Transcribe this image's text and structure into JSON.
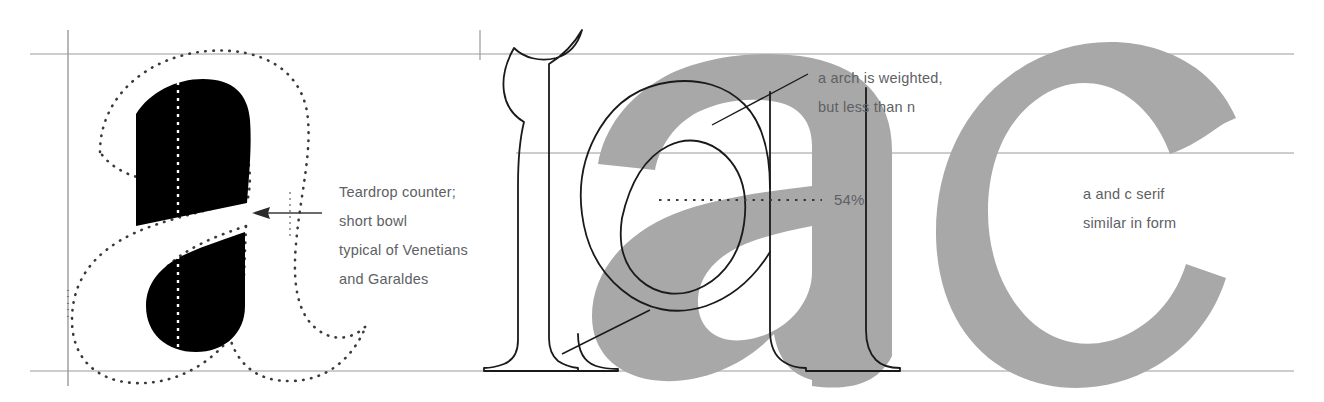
{
  "figure": {
    "kind": "typography-anatomy-diagram",
    "background": "#ffffff",
    "ink_black": "#000000",
    "ink_gray": "#a8a8a8",
    "guide_gray": "#9a9a9a",
    "text_gray": "#5d6164"
  },
  "panels": {
    "left": {
      "name": "counterform-panel",
      "glyph": "a",
      "glyph_style": "dotted-outline-with-solid-counters",
      "counters": [
        "teardrop counter",
        "short bowl"
      ],
      "center_line_style": "white-dotted"
    },
    "middle": {
      "name": "overlay-comparison-panel",
      "glyph": "a",
      "glyph_style": "gray-sans-with-black-serif-outline",
      "measurement": "54%"
    },
    "right": {
      "name": "serif-comparison-panel",
      "glyph": "c",
      "glyph_style": "gray-filled"
    }
  },
  "annotations": {
    "left": "Teardrop counter;\nshort bowl\ntypical of Venetians\nand Garaldes",
    "middle": "a arch is weighted,\nbut less than n",
    "right": "a and c serif\nsimilar in form",
    "percent": "54%"
  },
  "guides": {
    "cap_line_y": 54,
    "x_height_line_y": 153,
    "baseline_y": 371,
    "vertical_left_x": 68,
    "vertical_mid_x": 480,
    "measure_line_y": 200
  }
}
